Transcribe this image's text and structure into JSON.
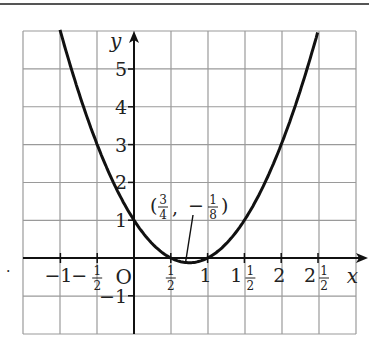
{
  "chart_data": {
    "type": "line",
    "title": "",
    "function": "y = 2x^2 - 3x + 1",
    "xlabel": "x",
    "ylabel": "y",
    "xlim": [
      -1.5,
      3
    ],
    "ylim": [
      -2,
      6
    ],
    "grid": true,
    "x_ticks": [
      {
        "value": -1,
        "label": "−1"
      },
      {
        "value": -0.5,
        "label": "−½"
      },
      {
        "value": 0,
        "label": "O"
      },
      {
        "value": 0.5,
        "label": "½"
      },
      {
        "value": 1,
        "label": "1"
      },
      {
        "value": 1.5,
        "label": "1½"
      },
      {
        "value": 2,
        "label": "2"
      },
      {
        "value": 2.5,
        "label": "2½"
      }
    ],
    "y_ticks": [
      {
        "value": 5,
        "label": "5"
      },
      {
        "value": 4,
        "label": "4"
      },
      {
        "value": 3,
        "label": "3"
      },
      {
        "value": 2,
        "label": "2"
      },
      {
        "value": 1,
        "label": "1"
      },
      {
        "value": -1,
        "label": "−1"
      }
    ],
    "series": [
      {
        "name": "parabola",
        "x": [
          -1,
          -0.5,
          0,
          0.5,
          0.75,
          1,
          1.5,
          2,
          2.5
        ],
        "y": [
          6,
          3,
          1,
          0,
          -0.125,
          0,
          1,
          3,
          6
        ]
      }
    ],
    "annotations": [
      {
        "text": "(3/4, −1/8)",
        "point": [
          0.75,
          -0.125
        ]
      }
    ]
  },
  "labels": {
    "x_axis": "x",
    "y_axis": "y",
    "origin": "O",
    "vertex_open": "(",
    "vertex_x_num": "3",
    "vertex_x_den": "4",
    "vertex_sep": ",",
    "vertex_minus": "−",
    "vertex_y_num": "1",
    "vertex_y_den": "8",
    "vertex_close": ")",
    "side_mark": "."
  }
}
